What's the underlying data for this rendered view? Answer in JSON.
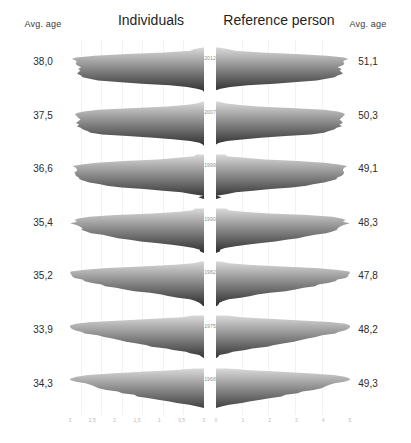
{
  "header": {
    "left_age_label": "Avg. age",
    "right_age_label": "Avg. age",
    "left_panel_title": "Individuals",
    "right_panel_title": "Reference person"
  },
  "chart_data": {
    "type": "area",
    "title": "",
    "subtitle": "",
    "xlabel": "",
    "ylabel": "",
    "grid": true,
    "legend_position": "none",
    "orientation": "mirrored-horizontal-density-ridgeline",
    "panels": [
      {
        "name": "Individuals",
        "side": "left",
        "xlim": [
          3.0,
          0.0
        ]
      },
      {
        "name": "Reference person",
        "side": "right",
        "xlim": [
          0.0,
          5.0
        ]
      }
    ],
    "x_ticks_left": [
      "3",
      "2,5",
      "2",
      "1,5",
      "1",
      "0,5",
      "0"
    ],
    "x_ticks_right": [
      "0",
      "1",
      "2",
      "3",
      "4",
      "5"
    ],
    "row_label_header": "year",
    "value_column_left_header": "Avg. age",
    "value_column_right_header": "Avg. age",
    "rows": [
      {
        "year": "2012",
        "avg_age_individuals": "38,0",
        "avg_age_reference": "51,1"
      },
      {
        "year": "2007",
        "avg_age_individuals": "37,5",
        "avg_age_reference": "50,3"
      },
      {
        "year": "1999",
        "avg_age_individuals": "36,6",
        "avg_age_reference": "49,1"
      },
      {
        "year": "1990",
        "avg_age_individuals": "35,4",
        "avg_age_reference": "48,3"
      },
      {
        "year": "1982",
        "avg_age_individuals": "35,2",
        "avg_age_reference": "47,8"
      },
      {
        "year": "1975",
        "avg_age_individuals": "33,9",
        "avg_age_reference": "48,2"
      },
      {
        "year": "1968",
        "avg_age_individuals": "34,3",
        "avg_age_reference": "49,3"
      }
    ],
    "series_left": [
      {
        "name": "2012",
        "profile": [
          0.03,
          0.06,
          0.12,
          0.3,
          0.58,
          0.82,
          0.95,
          1.0,
          1.0,
          0.99,
          0.98,
          0.97,
          0.97,
          0.96,
          0.95,
          0.94,
          0.93,
          0.92,
          0.9,
          0.86,
          0.78,
          0.64,
          0.46,
          0.3,
          0.18,
          0.1,
          0.05,
          0.02
        ]
      },
      {
        "name": "2007",
        "profile": [
          0.02,
          0.05,
          0.1,
          0.26,
          0.52,
          0.78,
          0.93,
          1.0,
          1.0,
          0.99,
          0.98,
          0.97,
          0.96,
          0.96,
          0.95,
          0.94,
          0.93,
          0.91,
          0.88,
          0.83,
          0.74,
          0.6,
          0.42,
          0.26,
          0.15,
          0.08,
          0.04,
          0.02
        ]
      },
      {
        "name": "1999",
        "profile": [
          0.04,
          0.09,
          0.18,
          0.38,
          0.64,
          0.85,
          0.96,
          1.0,
          1.0,
          0.99,
          0.98,
          0.97,
          0.96,
          0.95,
          0.94,
          0.92,
          0.9,
          0.87,
          0.82,
          0.75,
          0.64,
          0.5,
          0.35,
          0.22,
          0.12,
          0.06,
          0.03,
          0.01
        ]
      },
      {
        "name": "1990",
        "profile": [
          0.05,
          0.11,
          0.22,
          0.44,
          0.7,
          0.89,
          0.98,
          1.0,
          0.99,
          0.98,
          0.96,
          0.94,
          0.92,
          0.9,
          0.87,
          0.84,
          0.8,
          0.75,
          0.68,
          0.6,
          0.5,
          0.38,
          0.26,
          0.16,
          0.09,
          0.04,
          0.02,
          0.01
        ]
      },
      {
        "name": "1982",
        "profile": [
          0.06,
          0.13,
          0.26,
          0.5,
          0.76,
          0.92,
          0.99,
          1.0,
          0.99,
          0.97,
          0.95,
          0.92,
          0.89,
          0.85,
          0.81,
          0.76,
          0.7,
          0.63,
          0.55,
          0.46,
          0.37,
          0.27,
          0.18,
          0.11,
          0.06,
          0.03,
          0.01,
          0.0
        ]
      },
      {
        "name": "1975",
        "profile": [
          0.1,
          0.22,
          0.4,
          0.64,
          0.84,
          0.95,
          1.0,
          1.0,
          0.98,
          0.95,
          0.92,
          0.88,
          0.84,
          0.79,
          0.74,
          0.68,
          0.61,
          0.54,
          0.46,
          0.38,
          0.3,
          0.22,
          0.15,
          0.09,
          0.05,
          0.02,
          0.01,
          0.0
        ]
      },
      {
        "name": "1968",
        "profile": [
          0.12,
          0.26,
          0.46,
          0.7,
          0.88,
          0.97,
          1.0,
          0.99,
          0.97,
          0.94,
          0.9,
          0.86,
          0.81,
          0.76,
          0.7,
          0.64,
          0.57,
          0.5,
          0.42,
          0.34,
          0.26,
          0.19,
          0.12,
          0.07,
          0.04,
          0.02,
          0.01,
          0.0
        ]
      }
    ],
    "series_right": [
      {
        "name": "2012",
        "profile": [
          0.04,
          0.08,
          0.16,
          0.34,
          0.6,
          0.83,
          0.95,
          1.0,
          1.0,
          0.99,
          0.98,
          0.97,
          0.96,
          0.96,
          0.95,
          0.94,
          0.93,
          0.91,
          0.88,
          0.83,
          0.74,
          0.6,
          0.43,
          0.28,
          0.16,
          0.08,
          0.04,
          0.02
        ]
      },
      {
        "name": "2007",
        "profile": [
          0.03,
          0.07,
          0.14,
          0.3,
          0.56,
          0.8,
          0.94,
          1.0,
          1.0,
          0.99,
          0.98,
          0.97,
          0.96,
          0.95,
          0.94,
          0.93,
          0.91,
          0.89,
          0.85,
          0.79,
          0.69,
          0.55,
          0.38,
          0.24,
          0.13,
          0.07,
          0.03,
          0.01
        ]
      },
      {
        "name": "1999",
        "profile": [
          0.05,
          0.1,
          0.2,
          0.4,
          0.66,
          0.86,
          0.96,
          1.0,
          1.0,
          0.99,
          0.98,
          0.96,
          0.95,
          0.93,
          0.91,
          0.89,
          0.86,
          0.82,
          0.77,
          0.7,
          0.59,
          0.46,
          0.32,
          0.2,
          0.11,
          0.06,
          0.03,
          0.01
        ]
      },
      {
        "name": "1990",
        "profile": [
          0.06,
          0.12,
          0.24,
          0.46,
          0.72,
          0.9,
          0.98,
          1.0,
          0.99,
          0.98,
          0.96,
          0.94,
          0.92,
          0.89,
          0.86,
          0.82,
          0.78,
          0.72,
          0.65,
          0.57,
          0.47,
          0.36,
          0.25,
          0.15,
          0.08,
          0.04,
          0.02,
          0.01
        ]
      },
      {
        "name": "1982",
        "profile": [
          0.07,
          0.15,
          0.28,
          0.52,
          0.78,
          0.93,
          0.99,
          1.0,
          0.99,
          0.97,
          0.95,
          0.92,
          0.89,
          0.85,
          0.81,
          0.76,
          0.7,
          0.63,
          0.55,
          0.46,
          0.36,
          0.26,
          0.17,
          0.1,
          0.05,
          0.02,
          0.01,
          0.0
        ]
      },
      {
        "name": "1975",
        "profile": [
          0.11,
          0.24,
          0.42,
          0.66,
          0.85,
          0.96,
          1.0,
          1.0,
          0.98,
          0.95,
          0.92,
          0.88,
          0.84,
          0.79,
          0.74,
          0.68,
          0.61,
          0.54,
          0.46,
          0.37,
          0.29,
          0.21,
          0.14,
          0.08,
          0.04,
          0.02,
          0.01,
          0.0
        ]
      },
      {
        "name": "1968",
        "profile": [
          0.14,
          0.28,
          0.48,
          0.72,
          0.89,
          0.98,
          1.0,
          0.99,
          0.97,
          0.94,
          0.9,
          0.86,
          0.81,
          0.76,
          0.7,
          0.64,
          0.57,
          0.49,
          0.41,
          0.33,
          0.25,
          0.18,
          0.11,
          0.06,
          0.03,
          0.01,
          0.0,
          0.0
        ]
      }
    ],
    "colors": {
      "gradient_top": "#d9d9d9",
      "gradient_bottom": "#2e2e2e",
      "text": "#2b2b2b",
      "tick_text": "#b9b9b9",
      "year_text": "#8d8d8d",
      "background": "#ffffff"
    }
  }
}
